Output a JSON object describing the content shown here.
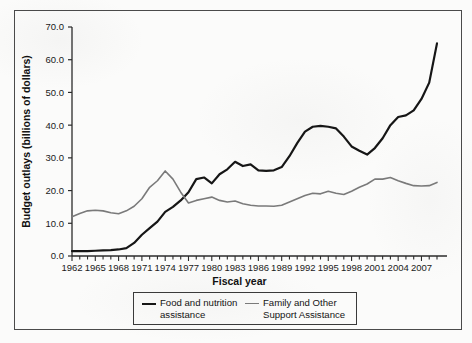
{
  "figure": {
    "background_color": "#fbfbfa",
    "frame_color": "#4a4a4a"
  },
  "chart_data": {
    "type": "line",
    "title": "",
    "xlabel": "Fiscal year",
    "ylabel": "Budget outlays (billions of dollars)",
    "xlim": [
      1962,
      2009
    ],
    "ylim": [
      0.0,
      70.0
    ],
    "yticks": [
      "0.0",
      "10.0",
      "20.0",
      "30.0",
      "40.0",
      "50.0",
      "60.0",
      "70.0"
    ],
    "ytick_values": [
      0,
      10,
      20,
      30,
      40,
      50,
      60,
      70
    ],
    "xticks": [
      "1962",
      "1965",
      "1968",
      "1971",
      "1974",
      "1977",
      "1980",
      "1983",
      "1986",
      "1989",
      "1992",
      "1995",
      "1998",
      "2001",
      "2004",
      "2007"
    ],
    "xtick_values": [
      1962,
      1965,
      1968,
      1971,
      1974,
      1977,
      1980,
      1983,
      1986,
      1989,
      1992,
      1995,
      1998,
      2001,
      2004,
      2007
    ],
    "minor_tick_interval": 1,
    "grid": false,
    "legend_position": "below-axes",
    "x": [
      1962,
      1963,
      1964,
      1965,
      1966,
      1967,
      1968,
      1969,
      1970,
      1971,
      1972,
      1973,
      1974,
      1975,
      1976,
      1977,
      1978,
      1979,
      1980,
      1981,
      1982,
      1983,
      1984,
      1985,
      1986,
      1987,
      1988,
      1989,
      1990,
      1991,
      1992,
      1993,
      1994,
      1995,
      1996,
      1997,
      1998,
      1999,
      2000,
      2001,
      2002,
      2003,
      2004,
      2005,
      2006,
      2007,
      2008,
      2009
    ],
    "series": [
      {
        "name": "Food and nutrition assistance",
        "color": "#161616",
        "line_width": 2.2,
        "values": [
          1.5,
          1.5,
          1.5,
          1.6,
          1.7,
          1.8,
          2.0,
          2.4,
          4.0,
          6.5,
          8.5,
          10.5,
          13.5,
          15.0,
          17.0,
          19.5,
          23.5,
          24.0,
          22.2,
          25.0,
          26.5,
          28.8,
          27.5,
          28.0,
          26.2,
          26.0,
          26.2,
          27.2,
          30.5,
          34.5,
          38.0,
          39.5,
          39.8,
          39.5,
          39.0,
          36.5,
          33.5,
          32.2,
          31.0,
          33.0,
          36.0,
          40.0,
          42.5,
          43.0,
          44.5,
          48.0,
          53.0,
          65.0
        ]
      },
      {
        "name": "Family and Other Support Assistance",
        "color": "#7a7a7a",
        "line_width": 1.6,
        "values": [
          12.0,
          13.0,
          13.8,
          14.0,
          13.8,
          13.2,
          12.9,
          13.8,
          15.2,
          17.5,
          21.0,
          23.0,
          26.0,
          23.5,
          19.5,
          16.2,
          17.0,
          17.5,
          18.0,
          17.0,
          16.5,
          16.8,
          16.0,
          15.5,
          15.3,
          15.3,
          15.2,
          15.5,
          16.5,
          17.5,
          18.5,
          19.2,
          19.0,
          19.8,
          19.2,
          18.8,
          19.8,
          21.0,
          22.0,
          23.5,
          23.5,
          24.0,
          23.0,
          22.2,
          21.5,
          21.4,
          21.5,
          22.5
        ]
      }
    ]
  },
  "legend": {
    "entries": [
      {
        "label": "Food and nutrition\nassistance",
        "color": "#161616"
      },
      {
        "label": "Family and Other\nSupport Assistance",
        "color": "#7a7a7a"
      }
    ]
  }
}
